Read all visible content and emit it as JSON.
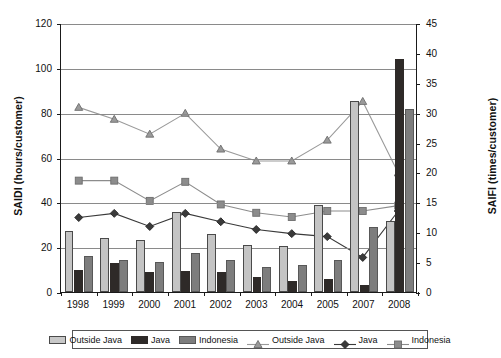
{
  "chart_data": {
    "type": "bar",
    "title": "",
    "subtitle": "",
    "xlabel": "",
    "ylabel": "SAIDI (hours/customer)",
    "y2label": "SAIFI (times/customer)",
    "categories": [
      "1998",
      "1999",
      "2000",
      "2001",
      "2002",
      "2003",
      "2004",
      "2005",
      "2007",
      "2008"
    ],
    "ylim": [
      0,
      120
    ],
    "yticks": [
      0,
      20,
      40,
      60,
      80,
      100,
      120
    ],
    "y2lim": [
      0,
      45
    ],
    "y2ticks": [
      0,
      5,
      10,
      15,
      20,
      25,
      30,
      35,
      40,
      45
    ],
    "grid": true,
    "legend_position": "bottom",
    "series": [
      {
        "name": "Outside Java",
        "kind": "bar",
        "axis": "left",
        "color": "#c4c4c4",
        "values": [
          27,
          24,
          23,
          35.5,
          26,
          21,
          20.5,
          39,
          85,
          31.5
        ]
      },
      {
        "name": "Java",
        "kind": "bar",
        "axis": "left",
        "color": "#2e2a28",
        "values": [
          10,
          13,
          9,
          9.5,
          9,
          6.5,
          5,
          6,
          3,
          104
        ]
      },
      {
        "name": "Indonesia",
        "kind": "bar",
        "axis": "left",
        "color": "#7d7d7d",
        "values": [
          16,
          14.5,
          13.5,
          17.5,
          14.5,
          11,
          12,
          14.5,
          29,
          81.5
        ]
      },
      {
        "name": "Outside Java",
        "kind": "line",
        "axis": "right",
        "color": "#9a9a9a",
        "marker": "triangle",
        "values": [
          31,
          29,
          26.5,
          30,
          24,
          22,
          22,
          25.5,
          32,
          20
        ]
      },
      {
        "name": "Java",
        "kind": "line",
        "axis": "right",
        "color": "#3a3a3a",
        "marker": "diamond",
        "values": [
          12.5,
          13.2,
          11,
          13.2,
          11.8,
          10.5,
          9.8,
          9.3,
          5.8,
          13.6
        ]
      },
      {
        "name": "Indonesia",
        "kind": "line",
        "axis": "right",
        "color": "#8c8c8c",
        "marker": "square",
        "values": [
          18.7,
          18.7,
          15.3,
          18.5,
          14.7,
          13.3,
          12.6,
          13.6,
          13.6,
          14.5
        ]
      }
    ]
  },
  "legend": {
    "bar_entries": [
      {
        "label": "Outside Java",
        "swatch": "outside"
      },
      {
        "label": "Java",
        "swatch": "java"
      },
      {
        "label": "Indonesia",
        "swatch": "indonesia"
      }
    ],
    "line_entries": [
      {
        "label": "Outside Java",
        "marker": "triangle-icon"
      },
      {
        "label": "Java",
        "marker": "diamond-icon"
      },
      {
        "label": "Indonesia",
        "marker": "square-icon"
      }
    ]
  }
}
